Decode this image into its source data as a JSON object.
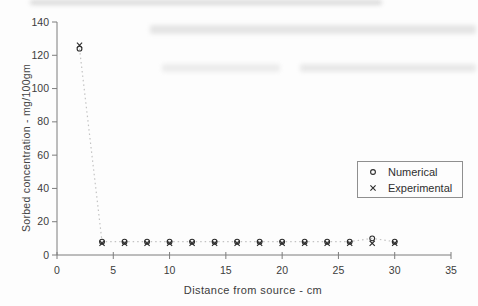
{
  "chart_data": {
    "type": "scatter",
    "title": "",
    "xlabel": "Distance from source - cm",
    "ylabel": "Sorbed concentration - mg/100gm",
    "xlim": [
      0,
      35
    ],
    "ylim": [
      0,
      140
    ],
    "xticks": [
      0,
      5,
      10,
      15,
      20,
      25,
      30,
      35
    ],
    "yticks": [
      0,
      20,
      40,
      60,
      80,
      100,
      120,
      140
    ],
    "grid": false,
    "legend_position": "right-middle",
    "x": [
      2,
      4,
      6,
      8,
      10,
      12,
      14,
      16,
      18,
      20,
      22,
      24,
      26,
      28,
      30
    ],
    "series": [
      {
        "name": "Numerical",
        "marker": "circle",
        "line_style": "dotted",
        "values": [
          124,
          8,
          8,
          8,
          8,
          8,
          8,
          8,
          8,
          8,
          8,
          8,
          8,
          10,
          8
        ]
      },
      {
        "name": "Experimental",
        "marker": "x",
        "line_style": "none",
        "values": [
          126,
          7,
          7,
          7,
          7,
          7,
          7,
          7,
          7,
          7,
          7,
          7,
          7,
          7,
          7
        ]
      }
    ],
    "colors": {
      "axis": "#7d7d7d",
      "marker": "#2b2b2b",
      "dotted_line": "#c3c3c3",
      "text": "#3c3c3c"
    }
  }
}
